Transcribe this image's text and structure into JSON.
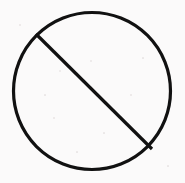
{
  "image": {
    "kind": "scanned-line-drawing",
    "subject": "prohibition-sign",
    "alt_text": "No entry / prohibition symbol: a black circle crossed by a diagonal slash",
    "width": 185,
    "height": 183,
    "background_color": "#fbfafa",
    "ink_color": "#111111",
    "has_text": false,
    "caption": ""
  },
  "shapes": {
    "circle": {
      "name": "outer-circle",
      "center_x": 92,
      "center_y": 91,
      "radius": 78.5,
      "stroke_width": 3.2,
      "stroke_color": "#111111",
      "fill": "none"
    },
    "slash": {
      "name": "diagonal-slash",
      "x1": 36,
      "y1": 34,
      "x2": 152,
      "y2": 149,
      "stroke_width": 3.2,
      "stroke_color": "#111111",
      "direction": "top-left-to-bottom-right"
    }
  },
  "texture": {
    "speckles": [
      {
        "x": 60,
        "y": 71,
        "d": 2.0
      },
      {
        "x": 91,
        "y": 61,
        "d": 1.6
      },
      {
        "x": 54,
        "y": 118,
        "d": 1.4
      },
      {
        "x": 131,
        "y": 95,
        "d": 1.3
      },
      {
        "x": 104,
        "y": 133,
        "d": 1.2
      },
      {
        "x": 45,
        "y": 95,
        "d": 1.2
      },
      {
        "x": 143,
        "y": 58,
        "d": 1.1
      },
      {
        "x": 77,
        "y": 152,
        "d": 1.1
      },
      {
        "x": 20,
        "y": 25,
        "d": 1.3
      },
      {
        "x": 168,
        "y": 166,
        "d": 1.2
      }
    ]
  }
}
